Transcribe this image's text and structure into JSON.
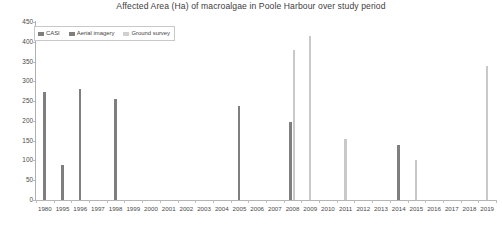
{
  "chart_data": {
    "type": "bar",
    "title": "Affected Area (Ha) of macroalgae in Poole Harbour over study period",
    "xlabel": "",
    "ylabel": "",
    "ylim": [
      0,
      450
    ],
    "ytick_step": 50,
    "yticks": [
      0,
      50,
      100,
      150,
      200,
      250,
      300,
      350,
      400,
      450
    ],
    "grid": false,
    "legend_position": "top-left",
    "categories": [
      "1980",
      "1995",
      "1996",
      "1997",
      "1998",
      "1999",
      "2000",
      "2001",
      "2002",
      "2003",
      "2004",
      "2005",
      "2006",
      "2007",
      "2008",
      "2009",
      "2010",
      "2011",
      "2012",
      "2013",
      "2014",
      "2015",
      "2016",
      "2017",
      "2018",
      "2019"
    ],
    "series": [
      {
        "name": "CASI",
        "color": "#7f7f7f",
        "values": [
          272,
          88,
          281,
          null,
          256,
          null,
          null,
          null,
          null,
          null,
          null,
          238,
          null,
          null,
          196,
          null,
          null,
          null,
          null,
          null,
          138,
          null,
          null,
          null,
          null,
          null
        ]
      },
      {
        "name": "Aerial imagery",
        "color": "#7f7f7f",
        "values": [
          null,
          null,
          null,
          null,
          null,
          null,
          null,
          null,
          null,
          null,
          null,
          null,
          null,
          null,
          null,
          null,
          null,
          null,
          null,
          null,
          null,
          null,
          null,
          null,
          null,
          null
        ]
      },
      {
        "name": "Ground survey",
        "color": "#c9c9c9",
        "values": [
          null,
          null,
          null,
          null,
          null,
          null,
          null,
          null,
          null,
          null,
          null,
          null,
          null,
          null,
          379,
          415,
          null,
          155,
          null,
          null,
          null,
          100,
          null,
          null,
          null,
          338
        ]
      }
    ]
  },
  "legend": {
    "items": [
      {
        "label": "CASI",
        "key": "casi"
      },
      {
        "label": "Aerial imagery",
        "key": "aerial"
      },
      {
        "label": "Ground survey",
        "key": "ground"
      }
    ]
  }
}
